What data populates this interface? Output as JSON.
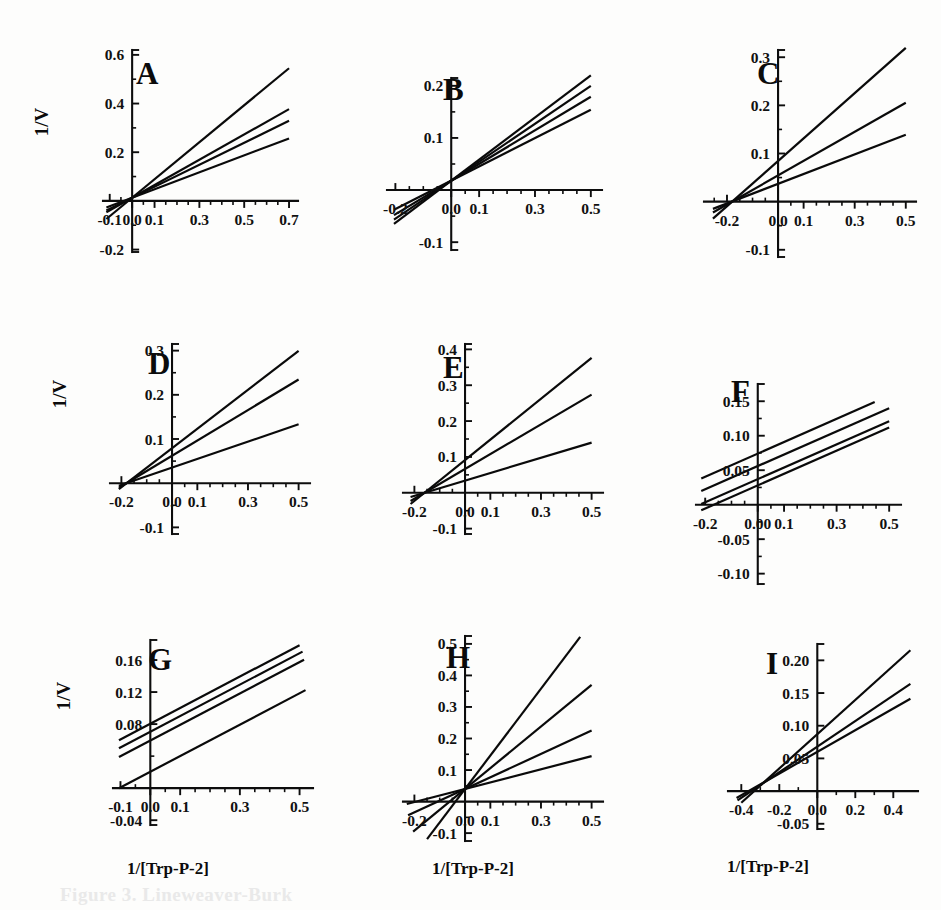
{
  "figure": {
    "ylabel": "1/V",
    "xlabel": "1/[Trp-P-2]",
    "caption_partial": "Figure 3.  Lineweaver-Burk"
  },
  "chart_data": [
    {
      "id": "A",
      "type": "line",
      "title": "A",
      "xlabel": "",
      "ylabel": "1/V",
      "xlim": [
        -0.13,
        0.74
      ],
      "ylim": [
        -0.21,
        0.62
      ],
      "xticks": [
        -0.1,
        0.0,
        0.1,
        0.3,
        0.5,
        0.7
      ],
      "xticklabels": [
        "-0.1",
        "0.0",
        "0.1",
        "0.3",
        "0.5",
        "0.7"
      ],
      "yticks": [
        -0.2,
        0.0,
        0.2,
        0.4,
        0.6
      ],
      "yticklabels": [
        "-0.2",
        "0.0",
        "0.2",
        "0.4",
        "0.6"
      ],
      "xminor": [
        -0.05,
        0.05,
        0.15,
        0.2,
        0.25,
        0.35,
        0.4,
        0.45,
        0.55,
        0.6,
        0.65
      ],
      "yminor": [
        -0.1,
        0.1,
        0.3,
        0.5
      ],
      "lines": [
        {
          "name": "line-1",
          "slope": 0.76,
          "intercept": 0.013,
          "x_from": -0.115,
          "x_to": 0.7
        },
        {
          "name": "line-2",
          "slope": 0.52,
          "intercept": 0.013,
          "x_from": -0.115,
          "x_to": 0.7
        },
        {
          "name": "line-3",
          "slope": 0.452,
          "intercept": 0.013,
          "x_from": -0.115,
          "x_to": 0.7
        },
        {
          "name": "line-4",
          "slope": 0.348,
          "intercept": 0.013,
          "x_from": -0.115,
          "x_to": 0.7
        }
      ]
    },
    {
      "id": "B",
      "type": "line",
      "title": "B",
      "xlabel": "",
      "ylabel": "",
      "xlim": [
        -0.23,
        0.54
      ],
      "ylim": [
        -0.115,
        0.215
      ],
      "xticks": [
        -0.2,
        0.0,
        0.1,
        0.3,
        0.5
      ],
      "xticklabels": [
        "-0.2",
        "0.0",
        "0.1",
        "0.3",
        "0.5"
      ],
      "yticks": [
        -0.1,
        0.0,
        0.1,
        0.2
      ],
      "yticklabels": [
        "-0.1",
        "0.0",
        "0.1",
        "0.2"
      ],
      "xminor": [
        -0.15,
        -0.1,
        -0.05,
        0.05,
        0.15,
        0.2,
        0.25,
        0.35,
        0.4,
        0.45
      ],
      "yminor": [
        -0.05,
        0.05,
        0.15
      ],
      "lines": [
        {
          "name": "line-1",
          "slope": 0.404,
          "intercept": 0.018,
          "x_from": -0.205,
          "x_to": 0.5
        },
        {
          "name": "line-2",
          "slope": 0.364,
          "intercept": 0.018,
          "x_from": -0.205,
          "x_to": 0.5
        },
        {
          "name": "line-3",
          "slope": 0.322,
          "intercept": 0.018,
          "x_from": -0.205,
          "x_to": 0.5
        },
        {
          "name": "line-4",
          "slope": 0.272,
          "intercept": 0.018,
          "x_from": -0.205,
          "x_to": 0.5
        }
      ]
    },
    {
      "id": "C",
      "type": "line",
      "title": "C",
      "xlabel": "",
      "ylabel": "",
      "xlim": [
        -0.29,
        0.54
      ],
      "ylim": [
        -0.115,
        0.315
      ],
      "xticks": [
        -0.2,
        0.0,
        0.1,
        0.3,
        0.5
      ],
      "xticklabels": [
        "-0.2",
        "0.0",
        "0.1",
        "0.3",
        "0.5"
      ],
      "yticks": [
        -0.1,
        0.0,
        0.1,
        0.2,
        0.3
      ],
      "yticklabels": [
        "-0.1",
        "0.0",
        "0.1",
        "0.2",
        "0.3"
      ],
      "xminor": [
        -0.25,
        -0.15,
        -0.1,
        -0.05,
        0.05,
        0.15,
        0.2,
        0.25,
        0.35,
        0.4,
        0.45
      ],
      "yminor": [
        -0.05,
        0.05,
        0.15,
        0.25
      ],
      "lines": [
        {
          "name": "line-1",
          "slope": 0.47,
          "intercept": 0.0845,
          "x_from": -0.255,
          "x_to": 0.5
        },
        {
          "name": "line-2",
          "slope": 0.302,
          "intercept": 0.0545,
          "x_from": -0.255,
          "x_to": 0.5
        },
        {
          "name": "line-3",
          "slope": 0.204,
          "intercept": 0.037,
          "x_from": -0.255,
          "x_to": 0.5
        }
      ]
    },
    {
      "id": "D",
      "type": "line",
      "title": "D",
      "xlabel": "",
      "ylabel": "1/V",
      "xlim": [
        -0.245,
        0.545
      ],
      "ylim": [
        -0.115,
        0.315
      ],
      "xticks": [
        -0.2,
        0.0,
        0.1,
        0.3,
        0.5
      ],
      "xticklabels": [
        "-0.2",
        "0.0",
        "0.1",
        "0.3",
        "0.5"
      ],
      "yticks": [
        -0.1,
        0.0,
        0.1,
        0.2,
        0.3
      ],
      "yticklabels": [
        "-0.1",
        "0.0",
        "0.1",
        "0.2",
        "0.3"
      ],
      "xminor": [
        -0.15,
        -0.1,
        -0.05,
        0.05,
        0.15,
        0.2,
        0.25,
        0.35,
        0.4,
        0.45
      ],
      "yminor": [
        -0.05,
        0.05,
        0.15,
        0.25
      ],
      "lines": [
        {
          "name": "line-1",
          "slope": 0.44,
          "intercept": 0.0792,
          "x_from": -0.21,
          "x_to": 0.5
        },
        {
          "name": "line-2",
          "slope": 0.345,
          "intercept": 0.0621,
          "x_from": -0.21,
          "x_to": 0.5
        },
        {
          "name": "line-3",
          "slope": 0.196,
          "intercept": 0.0353,
          "x_from": -0.21,
          "x_to": 0.5
        }
      ]
    },
    {
      "id": "E",
      "type": "line",
      "title": "E",
      "xlabel": "",
      "ylabel": "",
      "xlim": [
        -0.245,
        0.545
      ],
      "ylim": [
        -0.115,
        0.415
      ],
      "xticks": [
        -0.2,
        0.0,
        0.1,
        0.3,
        0.5
      ],
      "xticklabels": [
        "-0.2",
        "0.0",
        "0.1",
        "0.3",
        "0.5"
      ],
      "yticks": [
        -0.1,
        0.0,
        0.1,
        0.2,
        0.3,
        0.4
      ],
      "yticklabels": [
        "-0.1",
        "0.0",
        "0.1",
        "0.2",
        "0.3",
        "0.4"
      ],
      "xminor": [
        -0.15,
        -0.1,
        -0.05,
        0.05,
        0.15,
        0.2,
        0.25,
        0.35,
        0.4,
        0.45
      ],
      "yminor": [
        -0.05,
        0.05,
        0.15,
        0.25,
        0.35
      ],
      "lines": [
        {
          "name": "line-1",
          "slope": 0.57,
          "intercept": 0.0912,
          "x_from": -0.215,
          "x_to": 0.5
        },
        {
          "name": "line-2",
          "slope": 0.415,
          "intercept": 0.0664,
          "x_from": -0.215,
          "x_to": 0.5
        },
        {
          "name": "line-3",
          "slope": 0.212,
          "intercept": 0.0339,
          "x_from": -0.215,
          "x_to": 0.5
        }
      ]
    },
    {
      "id": "F",
      "type": "line",
      "title": "F",
      "xlabel": "",
      "ylabel": "",
      "xlim": [
        -0.235,
        0.545
      ],
      "ylim": [
        -0.115,
        0.175
      ],
      "xticks": [
        -0.2,
        0.0,
        0.1,
        0.3,
        0.5
      ],
      "xticklabels": [
        "-0.2",
        "0.00",
        "0.1",
        "0.3",
        "0.5"
      ],
      "yticks": [
        -0.1,
        -0.05,
        0.05,
        0.1,
        0.15
      ],
      "yticklabels": [
        "-0.10",
        "-0.05",
        "0.05",
        "0.10",
        "0.15"
      ],
      "xminor": [
        -0.15,
        -0.1,
        -0.05,
        0.05,
        0.15,
        0.2,
        0.25,
        0.35,
        0.4,
        0.45
      ],
      "yminor": [
        -0.075,
        -0.025,
        0.025,
        0.075,
        0.125
      ],
      "lines": [
        {
          "name": "line-1",
          "slope": 0.168,
          "intercept": 0.074,
          "x_from": -0.215,
          "x_to": 0.445
        },
        {
          "name": "line-2",
          "slope": 0.168,
          "intercept": 0.056,
          "x_from": -0.215,
          "x_to": 0.5
        },
        {
          "name": "line-3",
          "slope": 0.168,
          "intercept": 0.037,
          "x_from": -0.215,
          "x_to": 0.5
        },
        {
          "name": "line-4",
          "slope": 0.168,
          "intercept": 0.028,
          "x_from": -0.215,
          "x_to": 0.5
        }
      ]
    },
    {
      "id": "G",
      "type": "line",
      "title": "G",
      "xlabel": "1/[Trp-P-2]",
      "ylabel": "1/V",
      "xlim": [
        -0.125,
        0.545
      ],
      "ylim": [
        -0.046,
        0.185
      ],
      "xticks": [
        -0.1,
        0.0,
        0.1,
        0.3,
        0.5
      ],
      "xticklabels": [
        "-0.1",
        "0.0",
        "0.1",
        "0.3",
        "0.5"
      ],
      "yticks": [
        -0.04,
        0.08,
        0.12,
        0.16
      ],
      "yticklabels": [
        "-0.04",
        "0.08",
        "0.12",
        "0.16"
      ],
      "xminor": [
        -0.05,
        0.05,
        0.15,
        0.2,
        0.25,
        0.35,
        0.4,
        0.45
      ],
      "yminor": [
        0.0,
        0.04
      ],
      "lines": [
        {
          "name": "line-1",
          "slope": 0.196,
          "intercept": 0.0805,
          "x_from": -0.105,
          "x_to": 0.5
        },
        {
          "name": "line-2",
          "slope": 0.196,
          "intercept": 0.0705,
          "x_from": -0.105,
          "x_to": 0.51
        },
        {
          "name": "line-3",
          "slope": 0.196,
          "intercept": 0.0595,
          "x_from": -0.105,
          "x_to": 0.515
        },
        {
          "name": "line-4",
          "slope": 0.196,
          "intercept": 0.0205,
          "x_from": -0.105,
          "x_to": 0.52
        }
      ]
    },
    {
      "id": "H",
      "type": "line",
      "title": "H",
      "xlabel": "1/[Trp-P-2]",
      "ylabel": "",
      "xlim": [
        -0.245,
        0.545
      ],
      "ylim": [
        -0.125,
        0.525
      ],
      "xticks": [
        -0.2,
        0.0,
        0.1,
        0.3,
        0.5
      ],
      "xticklabels": [
        "-0.2",
        "0.0",
        "0.1",
        "0.3",
        "0.5"
      ],
      "yticks": [
        -0.1,
        0.0,
        0.1,
        0.2,
        0.3,
        0.4,
        0.5
      ],
      "yticklabels": [
        "-0.1",
        "0.0",
        "0.1",
        "0.2",
        "0.3",
        "0.4",
        "0.5"
      ],
      "xminor": [
        -0.15,
        -0.1,
        -0.05,
        0.05,
        0.15,
        0.2,
        0.25,
        0.35,
        0.4,
        0.45
      ],
      "yminor": [
        -0.05,
        0.05,
        0.15,
        0.25,
        0.35,
        0.45
      ],
      "lines": [
        {
          "name": "line-1",
          "slope": 1.06,
          "intercept": 0.04,
          "x_from": -0.15,
          "x_to": 0.455
        },
        {
          "name": "line-2",
          "slope": 0.66,
          "intercept": 0.04,
          "x_from": -0.205,
          "x_to": 0.5
        },
        {
          "name": "line-3",
          "slope": 0.37,
          "intercept": 0.04,
          "x_from": -0.225,
          "x_to": 0.5
        },
        {
          "name": "line-4",
          "slope": 0.208,
          "intercept": 0.04,
          "x_from": -0.23,
          "x_to": 0.5
        }
      ]
    },
    {
      "id": "I",
      "type": "line",
      "title": "I",
      "xlabel": "1/[Trp-P-2]",
      "ylabel": "",
      "xlim": [
        -0.47,
        0.53
      ],
      "ylim": [
        -0.058,
        0.225
      ],
      "xticks": [
        -0.4,
        -0.2,
        0.0,
        0.2,
        0.4
      ],
      "xticklabels": [
        "-0.4",
        "-0.2",
        "0.0",
        "0.2",
        "0.4"
      ],
      "yticks": [
        -0.05,
        0.05,
        0.1,
        0.15,
        0.2
      ],
      "yticklabels": [
        "-0.05",
        "0.05",
        "0.10",
        "0.15",
        "0.20"
      ],
      "xminor": [
        -0.3,
        -0.1,
        0.1,
        0.3
      ],
      "yminor": [
        0.0
      ],
      "lines": [
        {
          "name": "line-1",
          "slope": 0.262,
          "intercept": 0.087,
          "x_from": -0.4,
          "x_to": 0.49
        },
        {
          "name": "line-2",
          "slope": 0.196,
          "intercept": 0.068,
          "x_from": -0.42,
          "x_to": 0.49
        },
        {
          "name": "line-3",
          "slope": 0.166,
          "intercept": 0.06,
          "x_from": -0.425,
          "x_to": 0.49
        }
      ]
    }
  ],
  "panel_layout": [
    {
      "id": "A",
      "left": 18,
      "top": 34,
      "width": 300,
      "height": 285,
      "plot_x": 85,
      "plot_y": 16,
      "plot_w": 195,
      "plot_h": 202,
      "letter_x": 118,
      "letter_y": 50,
      "ylab_x": 30,
      "ylab_y": 88,
      "xlab_x": 0,
      "xlab_y": 0
    },
    {
      "id": "B",
      "left": 325,
      "top": 34,
      "width": 300,
      "height": 285,
      "plot_x": 62,
      "plot_y": 44,
      "plot_w": 215,
      "plot_h": 172,
      "letter_x": 118,
      "letter_y": 66,
      "ylab_x": 0,
      "ylab_y": 0,
      "xlab_x": 0,
      "xlab_y": 0
    },
    {
      "id": "C",
      "left": 632,
      "top": 34,
      "width": 305,
      "height": 285,
      "plot_x": 72,
      "plot_y": 16,
      "plot_w": 212,
      "plot_h": 207,
      "letter_x": 125,
      "letter_y": 50,
      "ylab_x": 0,
      "ylab_y": 0,
      "xlab_x": 0,
      "xlab_y": 0
    },
    {
      "id": "D",
      "left": 18,
      "top": 330,
      "width": 300,
      "height": 280,
      "plot_x": 92,
      "plot_y": 14,
      "plot_w": 200,
      "plot_h": 190,
      "letter_x": 130,
      "letter_y": 44,
      "ylab_x": 48,
      "ylab_y": 64,
      "xlab_x": 0,
      "xlab_y": 0
    },
    {
      "id": "E",
      "left": 318,
      "top": 330,
      "width": 300,
      "height": 280,
      "plot_x": 85,
      "plot_y": 14,
      "plot_w": 200,
      "plot_h": 190,
      "letter_x": 125,
      "letter_y": 48,
      "ylab_x": 0,
      "ylab_y": 0,
      "xlab_x": 0,
      "xlab_y": 0
    },
    {
      "id": "F",
      "left": 618,
      "top": 330,
      "width": 320,
      "height": 285,
      "plot_x": 78,
      "plot_y": 54,
      "plot_w": 205,
      "plot_h": 200,
      "letter_x": 113,
      "letter_y": 72,
      "ylab_x": 0,
      "ylab_y": 0,
      "xlab_x": 0,
      "xlab_y": 0
    },
    {
      "id": "G",
      "left": 18,
      "top": 622,
      "width": 300,
      "height": 285,
      "plot_x": 95,
      "plot_y": 18,
      "plot_w": 200,
      "plot_h": 185,
      "letter_x": 130,
      "letter_y": 48,
      "ylab_x": 52,
      "ylab_y": 74,
      "xlab_x": 150,
      "xlab_y": 252
    },
    {
      "id": "H",
      "left": 318,
      "top": 622,
      "width": 300,
      "height": 285,
      "plot_x": 85,
      "plot_y": 14,
      "plot_w": 200,
      "plot_h": 205,
      "letter_x": 128,
      "letter_y": 46,
      "ylab_x": 0,
      "ylab_y": 0,
      "xlab_x": 155,
      "xlab_y": 252
    },
    {
      "id": "I",
      "left": 618,
      "top": 622,
      "width": 320,
      "height": 285,
      "plot_x": 110,
      "plot_y": 22,
      "plot_w": 190,
      "plot_h": 185,
      "letter_x": 148,
      "letter_y": 52,
      "ylab_x": 0,
      "ylab_y": 0,
      "xlab_x": 150,
      "xlab_y": 250
    }
  ]
}
